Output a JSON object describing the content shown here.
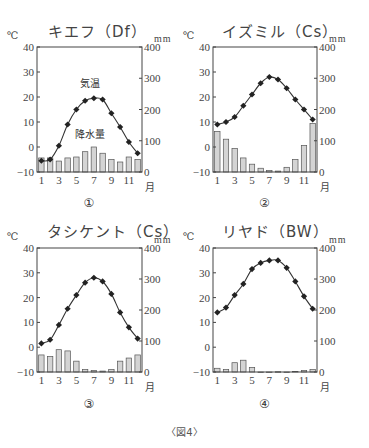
{
  "figure_caption": "〈図4〉",
  "chart_data": [
    {
      "type": "bar+line",
      "id": "1",
      "label": "①",
      "title": "キエフ（Df）",
      "city": "キエフ",
      "climate": "Df",
      "left_unit": "℃",
      "right_unit": "mm",
      "xlabel": "月",
      "x": [
        1,
        2,
        3,
        4,
        5,
        6,
        7,
        8,
        9,
        10,
        11,
        12
      ],
      "x_ticks": [
        "1",
        "3",
        "5",
        "7",
        "9",
        "11"
      ],
      "left_ylim": [
        -10,
        40
      ],
      "left_ticks": [
        "40",
        "30",
        "20",
        "10",
        "0",
        "−10"
      ],
      "right_ylim": [
        0,
        400
      ],
      "right_ticks": [
        "400",
        "300",
        "200",
        "100",
        "0"
      ],
      "annotations": [
        "気温",
        "降水量"
      ],
      "series": [
        {
          "name": "気温",
          "axis": "left",
          "type": "line",
          "values": [
            -5.5,
            -5,
            0.5,
            9,
            15,
            18.5,
            19.5,
            19,
            13.5,
            8,
            2,
            -2.5
          ]
        },
        {
          "name": "降水量",
          "axis": "right",
          "type": "bar",
          "values": [
            45,
            45,
            35,
            45,
            48,
            65,
            80,
            60,
            40,
            32,
            48,
            40
          ]
        }
      ]
    },
    {
      "type": "bar+line",
      "id": "2",
      "label": "②",
      "title": "イズミル（Cs）",
      "city": "イズミル",
      "climate": "Cs",
      "left_unit": "℃",
      "right_unit": "mm",
      "xlabel": "月",
      "x": [
        1,
        2,
        3,
        4,
        5,
        6,
        7,
        8,
        9,
        10,
        11,
        12
      ],
      "x_ticks": [
        "1",
        "3",
        "5",
        "7",
        "9",
        "11"
      ],
      "left_ylim": [
        -10,
        40
      ],
      "left_ticks": [
        "40",
        "30",
        "20",
        "10",
        "0",
        "−10"
      ],
      "right_ylim": [
        0,
        400
      ],
      "right_ticks": [
        "400",
        "300",
        "200",
        "100",
        "0"
      ],
      "series": [
        {
          "name": "気温",
          "axis": "left",
          "type": "line",
          "values": [
            9,
            10,
            12,
            16.5,
            21,
            25.5,
            28,
            27,
            23.5,
            19,
            15,
            11
          ]
        },
        {
          "name": "降水量",
          "axis": "right",
          "type": "bar",
          "values": [
            130,
            105,
            75,
            45,
            25,
            12,
            5,
            3,
            15,
            40,
            85,
            155
          ]
        }
      ]
    },
    {
      "type": "bar+line",
      "id": "3",
      "label": "③",
      "title": "タシケント（Cs）",
      "city": "タシケント",
      "climate": "Cs",
      "left_unit": "℃",
      "right_unit": "mm",
      "xlabel": "月",
      "x": [
        1,
        2,
        3,
        4,
        5,
        6,
        7,
        8,
        9,
        10,
        11,
        12
      ],
      "x_ticks": [
        "1",
        "3",
        "5",
        "7",
        "9",
        "11"
      ],
      "left_ylim": [
        -10,
        40
      ],
      "left_ticks": [
        "40",
        "30",
        "20",
        "10",
        "0",
        "−10"
      ],
      "right_ylim": [
        0,
        400
      ],
      "right_ticks": [
        "400",
        "300",
        "200",
        "100",
        "0"
      ],
      "series": [
        {
          "name": "気温",
          "axis": "left",
          "type": "line",
          "values": [
            1.5,
            3,
            9,
            15.5,
            21,
            26,
            28,
            26.5,
            21.5,
            14,
            8,
            3.5
          ]
        },
        {
          "name": "降水量",
          "axis": "right",
          "type": "bar",
          "values": [
            55,
            50,
            72,
            68,
            35,
            8,
            5,
            3,
            8,
            35,
            45,
            55
          ]
        }
      ]
    },
    {
      "type": "bar+line",
      "id": "4",
      "label": "④",
      "title": "リヤド（BW）",
      "city": "リヤド",
      "climate": "BW",
      "left_unit": "℃",
      "right_unit": "mm",
      "xlabel": "月",
      "x": [
        1,
        2,
        3,
        4,
        5,
        6,
        7,
        8,
        9,
        10,
        11,
        12
      ],
      "x_ticks": [
        "1",
        "3",
        "5",
        "7",
        "9",
        "11"
      ],
      "left_ylim": [
        -10,
        40
      ],
      "left_ticks": [
        "40",
        "30",
        "20",
        "10",
        "0",
        "−10"
      ],
      "right_ylim": [
        0,
        400
      ],
      "right_ticks": [
        "400",
        "300",
        "200",
        "100",
        "0"
      ],
      "series": [
        {
          "name": "気温",
          "axis": "left",
          "type": "line",
          "values": [
            14,
            16,
            21,
            25.5,
            31.5,
            34,
            35,
            35,
            32,
            26.5,
            20.5,
            15.5
          ]
        },
        {
          "name": "降水量",
          "axis": "right",
          "type": "bar",
          "values": [
            12,
            8,
            30,
            38,
            15,
            0,
            0,
            1,
            0,
            2,
            5,
            8
          ]
        }
      ]
    }
  ]
}
